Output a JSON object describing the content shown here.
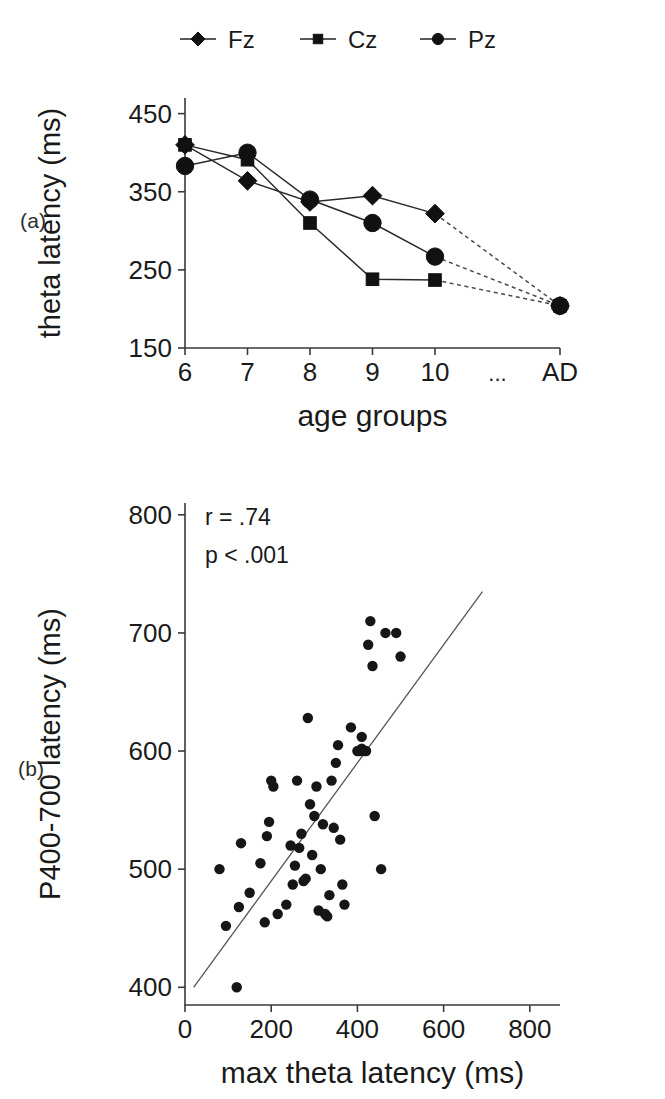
{
  "figure": {
    "background": "#ffffff",
    "ink_color": "#161616"
  },
  "panel_a": {
    "label": "(a)",
    "legend": {
      "position": "top",
      "entries": [
        {
          "label": "Fz",
          "marker": "diamond"
        },
        {
          "label": "Cz",
          "marker": "square"
        },
        {
          "label": "Pz",
          "marker": "circle"
        }
      ]
    },
    "chart_data": {
      "type": "line",
      "title": "",
      "xlabel": "age groups",
      "ylabel": "theta latency (ms)",
      "categories": [
        "6",
        "7",
        "8",
        "9",
        "10",
        "...",
        "AD"
      ],
      "xtick_labels": [
        "6",
        "7",
        "8",
        "9",
        "10",
        "...",
        "AD"
      ],
      "ytick_labels": [
        "450",
        "350",
        "250",
        "150"
      ],
      "ylim": [
        150,
        470
      ],
      "yticks": [
        150,
        250,
        350,
        450
      ],
      "grid": false,
      "series": [
        {
          "name": "Fz",
          "marker": "diamond",
          "values": [
            410,
            364,
            337,
            345,
            322,
            null,
            204
          ],
          "dashed_tail": true
        },
        {
          "name": "Cz",
          "marker": "square",
          "values": [
            410,
            391,
            310,
            238,
            237,
            null,
            204
          ],
          "dashed_tail": true
        },
        {
          "name": "Pz",
          "marker": "circle",
          "values": [
            383,
            400,
            340,
            310,
            267,
            null,
            204
          ],
          "dashed_tail": true
        }
      ]
    }
  },
  "panel_b": {
    "label": "(b)",
    "annotations": [
      {
        "name": "correlation",
        "text": "r = .74"
      },
      {
        "name": "p-value",
        "text": "p < .001"
      }
    ],
    "chart_data": {
      "type": "scatter",
      "title": "",
      "xlabel": "max theta latency (ms)",
      "ylabel": "P400-700 latency (ms)",
      "xtick_labels": [
        "0",
        "200",
        "400",
        "600",
        "800"
      ],
      "ytick_labels": [
        "400",
        "500",
        "600",
        "700",
        "800"
      ],
      "xticks": [
        0,
        200,
        400,
        600,
        800
      ],
      "yticks": [
        400,
        500,
        600,
        700,
        800
      ],
      "xlim": [
        0,
        870
      ],
      "ylim": [
        385,
        810
      ],
      "grid": false,
      "fit_line": {
        "x": [
          20,
          690
        ],
        "y": [
          400,
          735
        ]
      },
      "points": [
        [
          80,
          500
        ],
        [
          95,
          452
        ],
        [
          120,
          400
        ],
        [
          125,
          468
        ],
        [
          130,
          522
        ],
        [
          150,
          480
        ],
        [
          175,
          505
        ],
        [
          185,
          455
        ],
        [
          190,
          528
        ],
        [
          195,
          540
        ],
        [
          200,
          575
        ],
        [
          205,
          570
        ],
        [
          215,
          462
        ],
        [
          235,
          470
        ],
        [
          245,
          520
        ],
        [
          250,
          487
        ],
        [
          255,
          503
        ],
        [
          260,
          575
        ],
        [
          265,
          518
        ],
        [
          270,
          530
        ],
        [
          275,
          490
        ],
        [
          280,
          492
        ],
        [
          285,
          628
        ],
        [
          290,
          555
        ],
        [
          295,
          512
        ],
        [
          300,
          545
        ],
        [
          305,
          570
        ],
        [
          310,
          465
        ],
        [
          315,
          500
        ],
        [
          320,
          538
        ],
        [
          325,
          462
        ],
        [
          330,
          460
        ],
        [
          335,
          478
        ],
        [
          340,
          575
        ],
        [
          345,
          535
        ],
        [
          350,
          590
        ],
        [
          355,
          605
        ],
        [
          360,
          525
        ],
        [
          365,
          487
        ],
        [
          370,
          470
        ],
        [
          400,
          600
        ],
        [
          405,
          600
        ],
        [
          410,
          602
        ],
        [
          415,
          600
        ],
        [
          420,
          600
        ],
        [
          425,
          690
        ],
        [
          430,
          710
        ],
        [
          435,
          672
        ],
        [
          440,
          545
        ],
        [
          455,
          500
        ],
        [
          465,
          700
        ],
        [
          490,
          700
        ],
        [
          500,
          680
        ],
        [
          410,
          612
        ],
        [
          385,
          620
        ]
      ]
    }
  }
}
